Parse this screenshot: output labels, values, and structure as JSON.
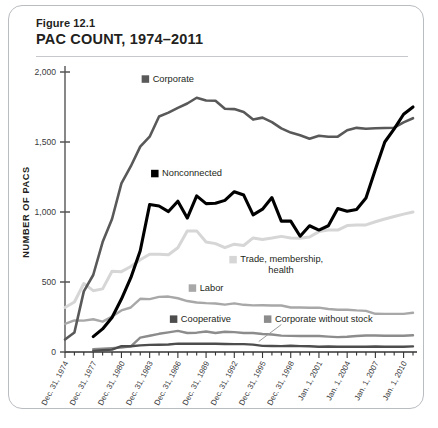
{
  "figure": {
    "number": "Figure 12.1",
    "title": "PAC COUNT, 1974–2011"
  },
  "chart_data": {
    "type": "line",
    "title": "PAC COUNT, 1974–2011",
    "xlabel": "",
    "ylabel": "NUMBER OF PACS",
    "ylim": [
      0,
      2000
    ],
    "yticks": [
      0,
      500,
      1000,
      1500,
      2000
    ],
    "ytick_labels": [
      "0",
      "500",
      "1,000",
      "1,500",
      "2,000"
    ],
    "grid": false,
    "legend_position": "inline-annotations",
    "x": [
      1974,
      1975,
      1976,
      1977,
      1978,
      1979,
      1980,
      1981,
      1982,
      1983,
      1984,
      1985,
      1986,
      1987,
      1988,
      1989,
      1990,
      1991,
      1992,
      1993,
      1994,
      1995,
      1996,
      1997,
      1998,
      1999,
      2000,
      2001,
      2002,
      2003,
      2004,
      2005,
      2006,
      2007,
      2008,
      2009,
      2010,
      2011
    ],
    "xticks": [
      1974,
      1977,
      1980,
      1983,
      1986,
      1989,
      1992,
      1995,
      1998,
      2001,
      2004,
      2007,
      2010
    ],
    "xtick_labels": [
      "Dec. 31, 1974",
      "Dec. 31, 1977",
      "Dec. 31, 1980",
      "Dec. 31, 1983",
      "Dec. 31, 1986",
      "Dec. 31, 1989",
      "Dec. 31, 1992",
      "Dec. 31, 1995",
      "Dec. 31, 1998",
      "Jan. 1, 2001",
      "Jan. 1, 2004",
      "Jan. 1, 2007",
      "Jan. 1, 2010"
    ],
    "series": [
      {
        "name": "Corporate",
        "color": "#595959",
        "label_x": 1983,
        "label_y": 1930,
        "values": [
          89,
          139,
          433,
          550,
          785,
          950,
          1204,
          1327,
          1467,
          1538,
          1682,
          1710,
          1744,
          1775,
          1816,
          1796,
          1795,
          1738,
          1735,
          1715,
          1660,
          1674,
          1642,
          1597,
          1567,
          1548,
          1523,
          1545,
          1538,
          1538,
          1584,
          1601,
          1595,
          1598,
          1600,
          1602,
          1640,
          1670
        ]
      },
      {
        "name": "Nonconnected",
        "color": "#000000",
        "label_x": 1984,
        "label_y": 1255,
        "values": [
          0,
          0,
          0,
          110,
          165,
          247,
          378,
          531,
          723,
          1053,
          1043,
          1003,
          1077,
          957,
          1115,
          1060,
          1062,
          1083,
          1145,
          1121,
          980,
          1020,
          1103,
          935,
          935,
          827,
          902,
          871,
          902,
          1025,
          1005,
          1018,
          1100,
          1303,
          1500,
          1594,
          1698,
          1750
        ]
      },
      {
        "name": "Trade, membership, health",
        "color": "#d6d6d6",
        "label_x": 1997,
        "label_y": 640,
        "values": [
          318,
          357,
          489,
          438,
          451,
          577,
          574,
          611,
          659,
          698,
          698,
          695,
          745,
          865,
          865,
          786,
          774,
          745,
          770,
          761,
          815,
          804,
          814,
          826,
          815,
          812,
          821,
          860,
          872,
          871,
          903,
          907,
          908,
          930,
          950,
          968,
          985,
          1000
        ]
      },
      {
        "name": "Labor",
        "color": "#a8a8a8",
        "label_x": 1988,
        "label_y": 437,
        "values": [
          201,
          226,
          224,
          234,
          217,
          253,
          297,
          318,
          380,
          378,
          394,
          396,
          384,
          364,
          354,
          349,
          346,
          338,
          347,
          337,
          333,
          334,
          332,
          332,
          318,
          318,
          316,
          317,
          307,
          302,
          302,
          297,
          294,
          273,
          272,
          272,
          272,
          280
        ]
      },
      {
        "name": "Corporate without stock",
        "color": "#8c8c8c",
        "label_x": 1996,
        "label_y": 215,
        "values": [
          0,
          0,
          0,
          20,
          24,
          28,
          32,
          41,
          103,
          116,
          130,
          140,
          151,
          136,
          138,
          146,
          136,
          145,
          142,
          136,
          136,
          129,
          125,
          117,
          115,
          114,
          114,
          114,
          110,
          106,
          109,
          114,
          118,
          118,
          116,
          116,
          116,
          120
        ]
      },
      {
        "name": "Cooperative",
        "color": "#4d4d4d",
        "label_x": 1986,
        "label_y": 215,
        "values": [
          0,
          0,
          0,
          8,
          12,
          17,
          42,
          41,
          47,
          51,
          52,
          54,
          60,
          59,
          59,
          59,
          59,
          57,
          56,
          56,
          53,
          44,
          43,
          42,
          45,
          42,
          41,
          38,
          39,
          38,
          38,
          38,
          38,
          39,
          38,
          38,
          38,
          40
        ]
      }
    ]
  }
}
